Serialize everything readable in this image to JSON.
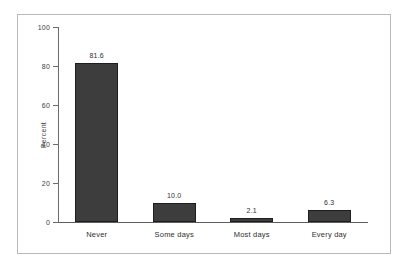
{
  "chart_data": {
    "type": "bar",
    "title": "",
    "subtitle": "",
    "xlabel": "",
    "ylabel": "Percent",
    "categories": [
      "Never",
      "Some days",
      "Most days",
      "Every day"
    ],
    "values": [
      81.6,
      10.0,
      2.1,
      6.3
    ],
    "value_labels": [
      "81.6",
      "10.0",
      "2.1",
      "6.3"
    ],
    "ylim": [
      0,
      100
    ],
    "ytick_values": [
      0,
      20,
      40,
      60,
      80,
      100
    ],
    "ytick_labels": [
      "0",
      "20",
      "40",
      "60",
      "80",
      "100"
    ],
    "grid": false,
    "legend": false,
    "legend_position": "none",
    "bar_color": "#3d3d3d",
    "bar_border_color": "#1d1d1d",
    "axis_color": "#6b6b6b",
    "text_color": "#2e2e2e",
    "frame_color": "#b9b9b9",
    "background_color": "#ffffff"
  }
}
